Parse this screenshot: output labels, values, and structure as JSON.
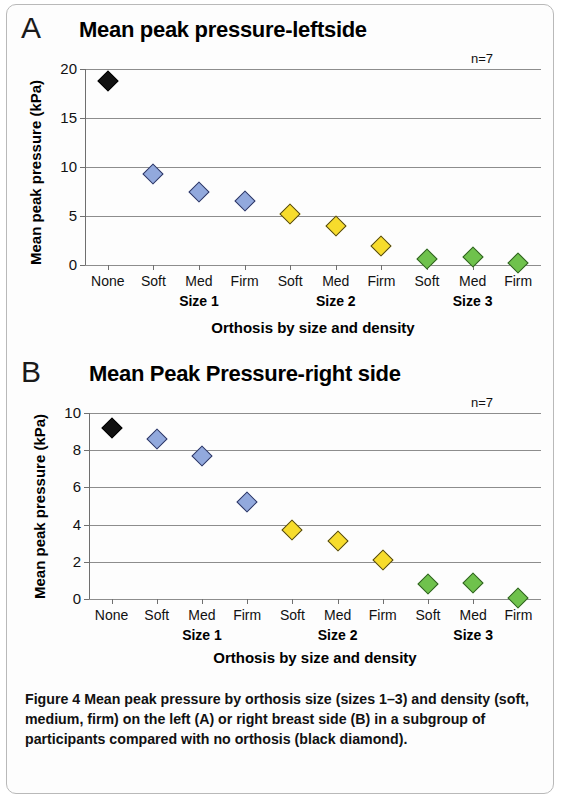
{
  "figure": {
    "caption_label": "Figure 4",
    "caption_text": " Mean peak pressure by orthosis size (sizes 1–3) and density (soft, medium, firm) on the left (A) or right breast side (B) in a subgroup of participants compared with no orthosis (black diamond).",
    "colors": {
      "black_marker": "#111111",
      "blue_marker": "#92a9dd",
      "yellow_marker": "#f7dc2c",
      "green_marker": "#6fc24c",
      "gridline": "#8d8d8d",
      "axis": "#6f6f6f"
    }
  },
  "panel_a": {
    "letter": "A",
    "n_label": "n=7",
    "size_groups": [
      "Size 1",
      "Size 2",
      "Size 3"
    ]
  },
  "panel_b": {
    "letter": "B",
    "n_label": "n=7",
    "size_groups": [
      "Size 1",
      "Size 2",
      "Size 3"
    ]
  },
  "chart_data": [
    {
      "type": "scatter",
      "panel": "A",
      "title": "Mean peak pressure-leftside",
      "xlabel": "Orthosis by size and density",
      "ylabel": "Mean peak pressure (kPa)",
      "annotation": "n=7",
      "categories": [
        "None",
        "Soft",
        "Med",
        "Firm",
        "Soft",
        "Med",
        "Firm",
        "Soft",
        "Med",
        "Firm"
      ],
      "group_labels": [
        "Size 1",
        "Size 2",
        "Size 3"
      ],
      "values": [
        18.8,
        9.3,
        7.5,
        6.5,
        5.2,
        4.0,
        1.9,
        0.6,
        0.8,
        0.2
      ],
      "point_colors": [
        "black",
        "blue",
        "blue",
        "blue",
        "yellow",
        "yellow",
        "yellow",
        "green",
        "green",
        "green"
      ],
      "ylim": [
        0,
        20
      ],
      "yticks": [
        0,
        5,
        10,
        15,
        20
      ],
      "ytick_labels": [
        "0",
        "5",
        "10",
        "15",
        "20"
      ],
      "grid": true,
      "legend": "none"
    },
    {
      "type": "scatter",
      "panel": "B",
      "title": "Mean Peak Pressure-right side",
      "xlabel": "Orthosis by size and density",
      "ylabel": "Mean peak pressure (kPa)",
      "annotation": "n=7",
      "categories": [
        "None",
        "Soft",
        "Med",
        "Firm",
        "Soft",
        "Med",
        "Firm",
        "Soft",
        "Med",
        "Firm"
      ],
      "group_labels": [
        "Size 1",
        "Size 2",
        "Size 3"
      ],
      "values": [
        9.2,
        8.6,
        7.7,
        5.2,
        3.7,
        3.1,
        2.1,
        0.8,
        0.85,
        0.05
      ],
      "point_colors": [
        "black",
        "blue",
        "blue",
        "blue",
        "yellow",
        "yellow",
        "yellow",
        "green",
        "green",
        "green"
      ],
      "ylim": [
        0,
        10
      ],
      "yticks": [
        0,
        2,
        4,
        6,
        8,
        10
      ],
      "ytick_labels": [
        "0",
        "2",
        "4",
        "6",
        "8",
        "10"
      ],
      "grid": true,
      "legend": "none"
    }
  ]
}
